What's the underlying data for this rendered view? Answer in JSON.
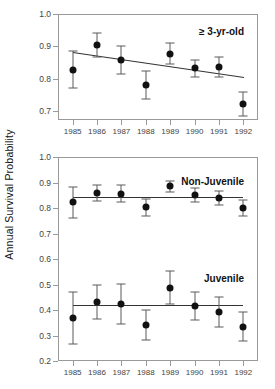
{
  "figure": {
    "y_axis_title": "Annual Survival Probability",
    "marker_color": "#111111",
    "errorbar_color": "#5a5a5a",
    "fitline_color": "#333333",
    "frame_color": "#9a9a9a"
  },
  "chart_data": [
    {
      "type": "scatter",
      "panel": "top",
      "title": "",
      "annotation": "≥ 3-yr-old",
      "xlabel": "",
      "ylabel": "Annual Survival Probability",
      "x": [
        1985,
        1986,
        1987,
        1988,
        1989,
        1990,
        1991,
        1992
      ],
      "xtick_labels": [
        "1985",
        "1986",
        "1987",
        "1988",
        "1989",
        "1990",
        "1991",
        "1992"
      ],
      "xlim": [
        1984.4,
        1992.6
      ],
      "ylim": [
        0.672,
        1.0
      ],
      "ytick_values": [
        0.7,
        0.8,
        0.9,
        1.0
      ],
      "ytick_labels": [
        "0.7",
        "0.8",
        "0.9",
        "1.0"
      ],
      "grid": false,
      "legend": false,
      "series": [
        {
          "name": "≥ 3-yr-old",
          "values": [
            0.828,
            0.903,
            0.857,
            0.781,
            0.877,
            0.832,
            0.836,
            0.721
          ],
          "err_low": [
            0.771,
            0.866,
            0.813,
            0.737,
            0.845,
            0.806,
            0.805,
            0.683
          ],
          "err_high": [
            0.884,
            0.94,
            0.901,
            0.825,
            0.91,
            0.859,
            0.868,
            0.76
          ],
          "fit_line": {
            "x_start": 1985,
            "y_start": 0.883,
            "x_end": 1992,
            "y_end": 0.806
          }
        }
      ]
    },
    {
      "type": "scatter",
      "panel": "bottom",
      "title": "",
      "annotation": "",
      "xlabel": "",
      "ylabel": "Annual Survival Probability",
      "x": [
        1985,
        1986,
        1987,
        1988,
        1989,
        1990,
        1991,
        1992
      ],
      "xtick_labels": [
        "1985",
        "1986",
        "1987",
        "1988",
        "1989",
        "1990",
        "1991",
        "1992"
      ],
      "xlim": [
        1984.4,
        1992.6
      ],
      "ylim": [
        0.2,
        1.0
      ],
      "ytick_values": [
        0.2,
        0.3,
        0.4,
        0.5,
        0.6,
        0.7,
        0.8,
        0.9,
        1.0
      ],
      "ytick_labels": [
        "0.2",
        "0.3",
        "0.4",
        "0.5",
        "0.6",
        "0.7",
        "0.8",
        "0.9",
        "1.0"
      ],
      "grid": false,
      "legend": false,
      "series": [
        {
          "name": "Non-Juvenile",
          "values": [
            0.822,
            0.86,
            0.856,
            0.803,
            0.885,
            0.851,
            0.838,
            0.799
          ],
          "err_low": [
            0.762,
            0.829,
            0.823,
            0.77,
            0.864,
            0.822,
            0.812,
            0.768
          ],
          "err_high": [
            0.882,
            0.892,
            0.89,
            0.837,
            0.906,
            0.88,
            0.865,
            0.83
          ],
          "fit_line": {
            "x_start": 1985,
            "y_start": 0.845,
            "x_end": 1992,
            "y_end": 0.845
          }
        },
        {
          "name": "Juvenile",
          "values": [
            0.368,
            0.432,
            0.425,
            0.34,
            0.488,
            0.417,
            0.392,
            0.334
          ],
          "err_low": [
            0.267,
            0.366,
            0.347,
            0.281,
            0.425,
            0.362,
            0.334,
            0.277
          ],
          "err_high": [
            0.47,
            0.498,
            0.503,
            0.399,
            0.551,
            0.472,
            0.45,
            0.391
          ],
          "fit_line": {
            "x_start": 1985,
            "y_start": 0.42,
            "x_end": 1992,
            "y_end": 0.42
          }
        }
      ]
    }
  ]
}
